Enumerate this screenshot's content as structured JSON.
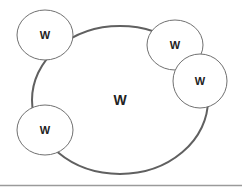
{
  "diagram": {
    "type": "venn-like",
    "colors": {
      "big_stroke": "#606060",
      "small_stroke": "#707070",
      "fill": "#ffffff",
      "text": "#222222",
      "baseline": "#9a9a9a"
    },
    "central": {
      "label": "W",
      "cx": 120,
      "cy": 100,
      "rx": 88,
      "ry": 74
    },
    "nodes": [
      {
        "id": "top-left",
        "label": "W",
        "cx": 45,
        "cy": 35,
        "rx": 28,
        "ry": 25
      },
      {
        "id": "top-right",
        "label": "W",
        "cx": 175,
        "cy": 45,
        "rx": 28,
        "ry": 25
      },
      {
        "id": "right",
        "label": "W",
        "cx": 200,
        "cy": 81,
        "rx": 27,
        "ry": 27
      },
      {
        "id": "bottom-left",
        "label": "W",
        "cx": 45,
        "cy": 130,
        "rx": 28,
        "ry": 25
      }
    ]
  }
}
